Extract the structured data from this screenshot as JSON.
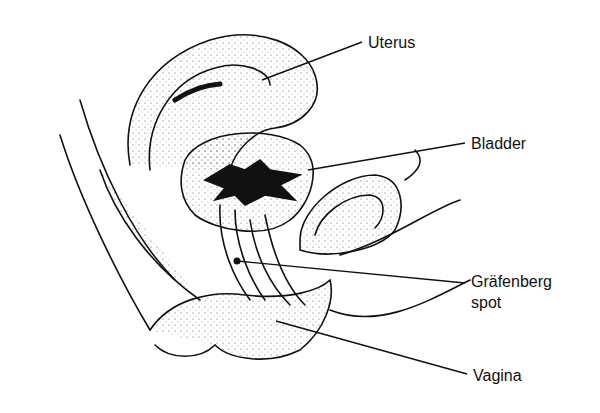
{
  "diagram": {
    "type": "anatomical-sagittal-section",
    "labels": [
      {
        "id": "uterus",
        "text": "Uterus",
        "x": 368,
        "y": 33,
        "line": {
          "x1": 362,
          "y1": 42,
          "x2": 262,
          "y2": 80
        }
      },
      {
        "id": "bladder",
        "text": "Bladder",
        "x": 471,
        "y": 134,
        "line": {
          "x1": 465,
          "y1": 143,
          "x2": 308,
          "y2": 170
        }
      },
      {
        "id": "g-spot",
        "text": "Gräfenberg",
        "text2": "spot",
        "x": 471,
        "y": 278,
        "line": {
          "x1": 465,
          "y1": 283,
          "x2": 237,
          "y2": 261
        }
      },
      {
        "id": "vagina",
        "text": "Vagina",
        "x": 473,
        "y": 366,
        "line": {
          "x1": 467,
          "y1": 374,
          "x2": 276,
          "y2": 321
        }
      }
    ],
    "colors": {
      "ink": "#111111",
      "background": "#ffffff"
    }
  }
}
